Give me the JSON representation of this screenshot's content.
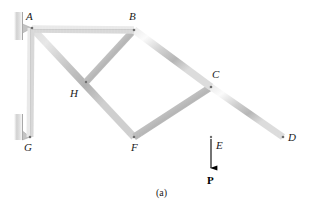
{
  "figure": {
    "caption": "(a)",
    "background_color": "#ffffff",
    "member_color": "#c8c8c8",
    "member_highlight_color": "#f2f2f2",
    "member_shadow_color": "#9a9a9a",
    "label_color": "#1a1a1a",
    "arrow_color": "#000000",
    "support_color": "#bdbdbd"
  },
  "joints": [
    {
      "id": "A",
      "label": "A",
      "x": 32,
      "y": 28,
      "label_x": 26,
      "label_y": 11
    },
    {
      "id": "B",
      "label": "B",
      "x": 134,
      "y": 30,
      "label_x": 129,
      "label_y": 11
    },
    {
      "id": "C",
      "label": "C",
      "x": 211,
      "y": 87,
      "label_x": 212,
      "label_y": 69
    },
    {
      "id": "D",
      "label": "D",
      "x": 283,
      "y": 137,
      "label_x": 288,
      "label_y": 132
    },
    {
      "id": "E",
      "label": "E",
      "x": 211,
      "y": 137,
      "label_x": 216,
      "label_y": 140
    },
    {
      "id": "F",
      "label": "F",
      "x": 134,
      "y": 137,
      "label_x": 131,
      "label_y": 142
    },
    {
      "id": "G",
      "label": "G",
      "x": 30,
      "y": 137,
      "label_x": 24,
      "label_y": 142
    },
    {
      "id": "H",
      "label": "H",
      "x": 86,
      "y": 82,
      "label_x": 70,
      "label_y": 88
    }
  ],
  "members": [
    {
      "name": "member-AB",
      "from": "A",
      "to": "B"
    },
    {
      "name": "member-BC",
      "from": "B",
      "to": "C"
    },
    {
      "name": "member-CD",
      "from": "C",
      "to": "D"
    },
    {
      "name": "member-AG",
      "from": "A",
      "to": "G"
    },
    {
      "name": "member-GF",
      "from": "G",
      "to": "F"
    },
    {
      "name": "member-FE",
      "from": "F",
      "to": "E"
    },
    {
      "name": "member-ED",
      "from": "E",
      "to": "D"
    },
    {
      "name": "member-BF",
      "from": "B",
      "to": "F"
    },
    {
      "name": "member-CE",
      "from": "C",
      "to": "E"
    },
    {
      "name": "member-AF",
      "from": "A",
      "to": "F"
    },
    {
      "name": "member-BH",
      "from": "B",
      "to": "H"
    },
    {
      "name": "member-FC",
      "from": "F",
      "to": "C"
    }
  ],
  "supports": [
    {
      "name": "wall-support-top",
      "at": "A",
      "x": 14,
      "y": 12,
      "width": 9,
      "height": 28
    },
    {
      "name": "wall-support-bottom",
      "at": "G",
      "x": 14,
      "y": 114,
      "width": 9,
      "height": 26
    }
  ],
  "load": {
    "name": "applied-load-P",
    "label": "P",
    "at_joint": "E",
    "direction": "down",
    "start_x": 211,
    "start_y": 137,
    "end_y": 170,
    "label_x": 207,
    "label_y": 175
  }
}
